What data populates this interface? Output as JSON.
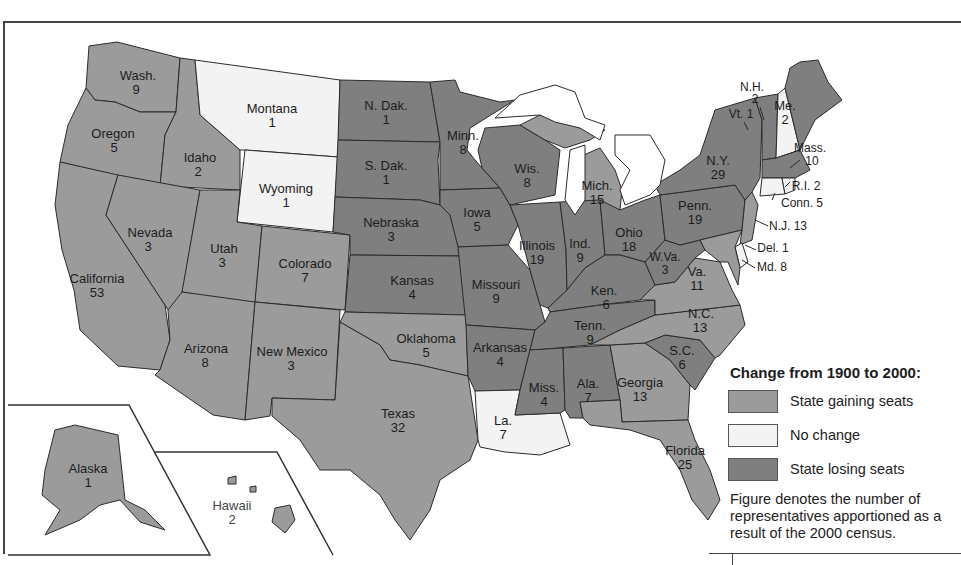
{
  "colors": {
    "gaining": "#9b9b9b",
    "no_change": "#f3f3f3",
    "losing": "#7f7f7f",
    "border": "#2b2b2b"
  },
  "legend": {
    "title": "Change from 1900 to 2000:",
    "items": [
      {
        "key": "gaining",
        "label": "State gaining seats"
      },
      {
        "key": "no_change",
        "label": "No change"
      },
      {
        "key": "losing",
        "label": "State losing seats"
      }
    ],
    "note": "Figure denotes the number of representatives apportioned as a result of the 2000 census."
  },
  "states": {
    "wa": {
      "name": "Wash.",
      "seats": "9",
      "change": "gaining"
    },
    "or": {
      "name": "Oregon",
      "seats": "5",
      "change": "gaining"
    },
    "ca": {
      "name": "California",
      "seats": "53",
      "change": "gaining"
    },
    "id": {
      "name": "Idaho",
      "seats": "2",
      "change": "gaining"
    },
    "nv": {
      "name": "Nevada",
      "seats": "3",
      "change": "gaining"
    },
    "mt": {
      "name": "Montana",
      "seats": "1",
      "change": "no_change"
    },
    "wy": {
      "name": "Wyoming",
      "seats": "1",
      "change": "no_change"
    },
    "ut": {
      "name": "Utah",
      "seats": "3",
      "change": "gaining"
    },
    "co": {
      "name": "Colorado",
      "seats": "7",
      "change": "gaining"
    },
    "az": {
      "name": "Arizona",
      "seats": "8",
      "change": "gaining"
    },
    "nm": {
      "name": "New Mexico",
      "seats": "3",
      "change": "gaining"
    },
    "nd": {
      "name": "N. Dak.",
      "seats": "1",
      "change": "losing"
    },
    "sd": {
      "name": "S. Dak.",
      "seats": "1",
      "change": "losing"
    },
    "ne": {
      "name": "Nebraska",
      "seats": "3",
      "change": "losing"
    },
    "ks": {
      "name": "Kansas",
      "seats": "4",
      "change": "losing"
    },
    "ok": {
      "name": "Oklahoma",
      "seats": "5",
      "change": "gaining"
    },
    "tx": {
      "name": "Texas",
      "seats": "32",
      "change": "gaining"
    },
    "mn": {
      "name": "Minn.",
      "seats": "8",
      "change": "losing"
    },
    "ia": {
      "name": "Iowa",
      "seats": "5",
      "change": "losing"
    },
    "mo": {
      "name": "Missouri",
      "seats": "9",
      "change": "losing"
    },
    "ar": {
      "name": "Arkansas",
      "seats": "4",
      "change": "losing"
    },
    "la": {
      "name": "La.",
      "seats": "7",
      "change": "no_change"
    },
    "wi": {
      "name": "Wis.",
      "seats": "8",
      "change": "losing"
    },
    "il": {
      "name": "Illinois",
      "seats": "19",
      "change": "losing"
    },
    "mi": {
      "name": "Mich.",
      "seats": "15",
      "change": "gaining"
    },
    "in": {
      "name": "Ind.",
      "seats": "9",
      "change": "losing"
    },
    "oh": {
      "name": "Ohio",
      "seats": "18",
      "change": "losing"
    },
    "ky": {
      "name": "Ken.",
      "seats": "6",
      "change": "losing"
    },
    "tn": {
      "name": "Tenn.",
      "seats": "9",
      "change": "losing"
    },
    "ms": {
      "name": "Miss.",
      "seats": "4",
      "change": "losing"
    },
    "al": {
      "name": "Ala.",
      "seats": "7",
      "change": "losing"
    },
    "ga": {
      "name": "Georgia",
      "seats": "13",
      "change": "gaining"
    },
    "fl": {
      "name": "Florida",
      "seats": "25",
      "change": "gaining"
    },
    "sc": {
      "name": "S.C.",
      "seats": "6",
      "change": "losing"
    },
    "nc": {
      "name": "N.C.",
      "seats": "13",
      "change": "gaining"
    },
    "va": {
      "name": "Va.",
      "seats": "11",
      "change": "gaining"
    },
    "wv": {
      "name": "W.Va.",
      "seats": "3",
      "change": "losing"
    },
    "pa": {
      "name": "Penn.",
      "seats": "19",
      "change": "losing"
    },
    "ny": {
      "name": "N.Y.",
      "seats": "29",
      "change": "losing"
    },
    "vt": {
      "name": "Vt.",
      "seats": "1",
      "label": "Vt. 1",
      "change": "losing"
    },
    "nh": {
      "name": "N.H.",
      "seats": "2",
      "change": "no_change"
    },
    "me": {
      "name": "Me.",
      "seats": "2",
      "change": "losing"
    },
    "ma": {
      "name": "Mass.",
      "seats": "10",
      "change": "losing"
    },
    "ri": {
      "name": "R.I.",
      "seats": "2",
      "label": "R.I. 2",
      "change": "no_change"
    },
    "ct": {
      "name": "Conn.",
      "seats": "5",
      "label": "Conn. 5",
      "change": "no_change"
    },
    "nj": {
      "name": "N.J.",
      "seats": "13",
      "label": "N.J. 13",
      "change": "gaining"
    },
    "de": {
      "name": "Del.",
      "seats": "1",
      "label": "Del. 1",
      "change": "no_change"
    },
    "md": {
      "name": "Md.",
      "seats": "8",
      "label": "Md. 8",
      "change": "gaining"
    },
    "ak": {
      "name": "Alaska",
      "seats": "1",
      "change": "gaining"
    },
    "hi": {
      "name": "Hawaii",
      "seats": "2",
      "change": "gaining"
    }
  }
}
